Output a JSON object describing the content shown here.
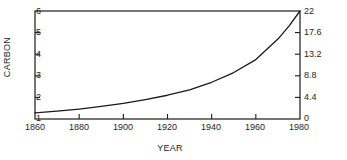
{
  "chart_data": {
    "type": "line",
    "title": "",
    "xlabel": "YEAR",
    "ylabel": "CARBON",
    "ylabel_right": "CARBON DIOXIDE",
    "xlim": [
      1860,
      1980
    ],
    "ylim": [
      1,
      6
    ],
    "ylim_right": [
      0,
      22
    ],
    "grid": false,
    "legend": "none",
    "xticks": [
      "1860",
      "1880",
      "1900",
      "1920",
      "1940",
      "1960",
      "1980"
    ],
    "xtick_values": [
      1860,
      1880,
      1900,
      1920,
      1940,
      1960,
      1980
    ],
    "yticks_left": [
      "6",
      "5",
      "4",
      "3",
      "2",
      "1"
    ],
    "ytick_values_left": [
      6,
      5,
      4,
      3,
      2,
      1
    ],
    "yticks_right": [
      "22",
      "17.6",
      "13.2",
      "8.8",
      "4.4",
      "0"
    ],
    "ytick_values_right": [
      22,
      17.6,
      13.2,
      8.8,
      4.4,
      0
    ],
    "series": [
      {
        "name": "carbon",
        "x": [
          1860,
          1870,
          1880,
          1890,
          1900,
          1910,
          1920,
          1930,
          1940,
          1950,
          1960,
          1970,
          1975,
          1980
        ],
        "values": [
          1.28,
          1.36,
          1.46,
          1.58,
          1.72,
          1.9,
          2.1,
          2.35,
          2.7,
          3.15,
          3.75,
          4.7,
          5.3,
          6.0
        ],
        "values_right": [
          1.23,
          1.58,
          2.02,
          2.55,
          3.17,
          3.96,
          4.84,
          5.94,
          7.48,
          9.46,
          12.1,
          16.28,
          18.92,
          22.0
        ],
        "color": "#1a1a1a"
      }
    ],
    "axis_color": "#1a1a1a",
    "background": "#ffffff"
  }
}
